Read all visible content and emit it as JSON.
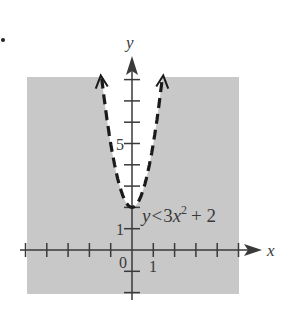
{
  "problem_marker": "•",
  "chart_data": {
    "type": "line",
    "title": "",
    "xlabel": "x",
    "ylabel": "y",
    "inequality_label": {
      "lhs": "y",
      "op": "<",
      "coef": "3",
      "var": "x",
      "exp": "2",
      "rest": "+ 2"
    },
    "equation": "y < 3x^2 + 2",
    "boundary": {
      "style": "dashed",
      "function": "3x^2 + 2",
      "vertex": [
        0,
        2
      ]
    },
    "shading": "outside parabola (below curve)",
    "x_ticks": [
      -5,
      -4,
      -3,
      -2,
      -1,
      1,
      2,
      3,
      4,
      5
    ],
    "y_ticks": [
      -2,
      -1,
      1,
      2,
      3,
      4,
      5,
      6,
      7,
      8
    ],
    "x_tick_labels": {
      "0": "0",
      "1": "1"
    },
    "y_tick_labels": {
      "1": "1",
      "5": "5"
    },
    "xlim": [
      -5,
      5
    ],
    "ylim": [
      -2,
      8
    ],
    "grid": false,
    "colors": {
      "shade": "#c8c8c8",
      "axis": "#3a3a3a",
      "curve": "#1a1a1a"
    }
  }
}
